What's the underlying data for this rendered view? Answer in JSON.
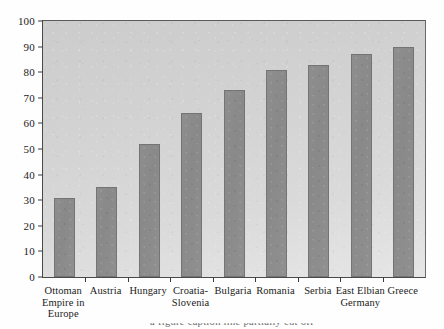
{
  "chart_data": {
    "type": "bar",
    "title": "",
    "xlabel": "",
    "ylabel": "",
    "ylim": [
      0,
      100
    ],
    "yticks": [
      0,
      10,
      20,
      30,
      40,
      50,
      60,
      70,
      80,
      90,
      100
    ],
    "grid": false,
    "legend": false,
    "categories": [
      "Ottoman Empire in Europe",
      "Austria",
      "Hungary",
      "Croatia-Slovenia",
      "Bulgaria",
      "Romania",
      "Serbia",
      "East Elbian Germany",
      "Greece"
    ],
    "category_lines": [
      [
        "Ottoman",
        "Empire in",
        "Europe"
      ],
      [
        "Austria"
      ],
      [
        "Hungary"
      ],
      [
        "Croatia-",
        "Slovenia"
      ],
      [
        "Bulgaria"
      ],
      [
        "Romania"
      ],
      [
        "Serbia"
      ],
      [
        "East Elbian",
        "Germany"
      ],
      [
        "Greece"
      ]
    ],
    "values": [
      31,
      35,
      52,
      64,
      73,
      81,
      83,
      87,
      90
    ],
    "colors": {
      "bar_fill": "#8e8e8e",
      "bar_border": "#747474",
      "plot_background": "#d6d6d6",
      "axis": "#3c3c3c",
      "text": "#1b1b1b"
    }
  },
  "caption": {
    "clipped_line": "a figure caption line partially cut off"
  }
}
